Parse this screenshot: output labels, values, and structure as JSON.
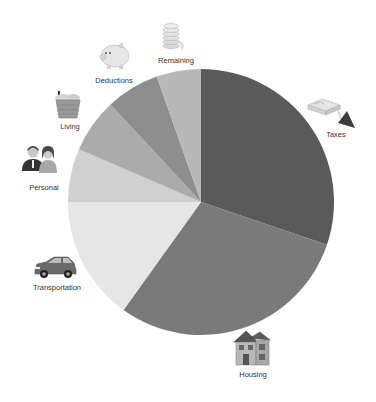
{
  "chart_data": {
    "type": "pie",
    "title": "",
    "start_angle_deg": 0,
    "direction": "clockwise",
    "categories": [
      "Taxes",
      "Housing",
      "Transportation",
      "Personal",
      "Living",
      "Deductions",
      "Remaining"
    ],
    "values": [
      30.2,
      29.7,
      15.1,
      6.5,
      6.6,
      6.5,
      5.4
    ],
    "units": "percent (estimated from slice angles)",
    "colors": [
      "#5a5a5a",
      "#7a7a7a",
      "#e6e6e6",
      "#d0d0d0",
      "#ababab",
      "#8e8e8e",
      "#b8b8b8"
    ],
    "icons": [
      "money-stack-icon",
      "house-icon",
      "car-icon",
      "people-icon",
      "grocery-basket-icon",
      "piggy-bank-icon",
      "coin-stack-icon"
    ],
    "legend": "none (labels placed around pie with icons)",
    "grid": false
  },
  "labels": {
    "taxes": "Taxes",
    "housing": "Housing",
    "transportation": "Transportation",
    "personal": "Personal",
    "living": "Living",
    "deductions": "Deductions",
    "remaining": "Remaining"
  }
}
